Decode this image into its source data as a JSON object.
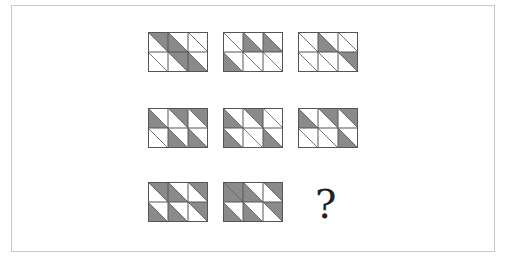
{
  "puzzle": {
    "description": "3x3 matrix of 3-column x 2-row grids; each cell split by a top-left to bottom-right diagonal; shading values: UR = upper-right triangle, LL = lower-left triangle, BOTH = whole cell, none = empty",
    "colors": {
      "shade": "#8a8a8a",
      "line": "#555555",
      "frame": "#c8c8c8",
      "background": "#ffffff"
    },
    "question_mark": "?",
    "tiles": [
      {
        "id": "r1c1",
        "cells": [
          [
            "UR",
            "LL",
            "none"
          ],
          [
            "none",
            "UR",
            "LL"
          ]
        ]
      },
      {
        "id": "r1c2",
        "cells": [
          [
            "none",
            "LL",
            "LL"
          ],
          [
            "LL",
            "none",
            "none"
          ]
        ]
      },
      {
        "id": "r1c3",
        "cells": [
          [
            "none",
            "LL",
            "none"
          ],
          [
            "none",
            "none",
            "UR"
          ]
        ]
      },
      {
        "id": "r2c1",
        "cells": [
          [
            "LL",
            "UR",
            "UR"
          ],
          [
            "none",
            "LL",
            "LL"
          ]
        ]
      },
      {
        "id": "r2c2",
        "cells": [
          [
            "LL",
            "UR",
            "none"
          ],
          [
            "LL",
            "none",
            "LL"
          ]
        ]
      },
      {
        "id": "r2c3",
        "cells": [
          [
            "LL",
            "UR",
            "UR"
          ],
          [
            "none",
            "none",
            "LL"
          ]
        ]
      },
      {
        "id": "r3c1",
        "cells": [
          [
            "UR",
            "LL",
            "UR"
          ],
          [
            "LL",
            "LL",
            "UR"
          ]
        ]
      },
      {
        "id": "r3c2",
        "cells": [
          [
            "BOTH",
            "LL",
            "UR"
          ],
          [
            "LL",
            "LL",
            "UR"
          ]
        ]
      }
    ],
    "missing_tile": "r3c3"
  }
}
